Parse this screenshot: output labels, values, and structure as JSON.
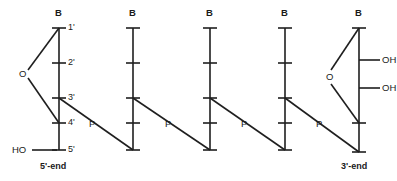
{
  "diagram": {
    "stroke_color": "#1f1f1f",
    "background_color": "#ffffff",
    "text_color": "#1a1a1a"
  },
  "ends": {
    "left_label": "5'-end",
    "right_label": "3'-end"
  },
  "terminal_groups": {
    "five_prime_hydroxyl": "HO",
    "three_prime_hydroxyl_upper": "OH",
    "three_prime_hydroxyl_lower": "OH"
  },
  "ring_oxygen": {
    "left_unit": "O",
    "right_unit": "O"
  },
  "carbon_positions": [
    {
      "id": "c1",
      "label": "1'"
    },
    {
      "id": "c2",
      "label": "2'"
    },
    {
      "id": "c3",
      "label": "3'"
    },
    {
      "id": "c4",
      "label": "4'"
    },
    {
      "id": "c5",
      "label": "5'"
    }
  ],
  "units": [
    {
      "index": 1,
      "base_label": "B",
      "x": 57,
      "has_sugar_ring": true,
      "has_position_labels": true,
      "has_terminal_ho": true
    },
    {
      "index": 2,
      "base_label": "B",
      "x": 131,
      "has_sugar_ring": false,
      "has_position_labels": false,
      "has_terminal_ho": false
    },
    {
      "index": 3,
      "base_label": "B",
      "x": 208,
      "has_sugar_ring": false,
      "has_position_labels": false,
      "has_terminal_ho": false
    },
    {
      "index": 4,
      "base_label": "B",
      "x": 283,
      "has_sugar_ring": false,
      "has_position_labels": false,
      "has_terminal_ho": false
    },
    {
      "index": 5,
      "base_label": "B",
      "x": 357,
      "has_sugar_ring": true,
      "has_position_labels": false,
      "has_terminal_ho": false
    }
  ],
  "phosphodiester_links": [
    {
      "index": 1,
      "label": "P",
      "from_unit": 1,
      "to_unit": 2
    },
    {
      "index": 2,
      "label": "P",
      "from_unit": 2,
      "to_unit": 3
    },
    {
      "index": 3,
      "label": "P",
      "from_unit": 3,
      "to_unit": 4
    },
    {
      "index": 4,
      "label": "P",
      "from_unit": 4,
      "to_unit": 5
    }
  ]
}
